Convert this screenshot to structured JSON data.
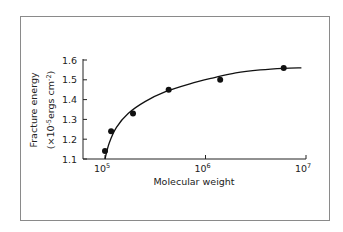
{
  "chart_data": {
    "type": "scatter",
    "title": "",
    "xlabel": "Molecular weight",
    "ylabel": "Fracture energy",
    "ylabel_units_prefix": "(×10",
    "ylabel_units_exp": "-5",
    "ylabel_units_mid": "ergs cm",
    "ylabel_units_exp2": "-2",
    "ylabel_units_suffix": ")",
    "x_scale": "log",
    "xlim": [
      63000,
      10000000
    ],
    "ylim": [
      1.1,
      1.6
    ],
    "grid": false,
    "legend": null,
    "x_ticks": [
      {
        "value": 100000,
        "base": "10",
        "exp": "5"
      },
      {
        "value": 1000000,
        "base": "10",
        "exp": "6"
      },
      {
        "value": 10000000,
        "base": "10",
        "exp": "7"
      }
    ],
    "y_ticks": [
      "1.1",
      "1.2",
      "1.3",
      "1.4",
      "1.5",
      "1.6"
    ],
    "series": [
      {
        "name": "Measured",
        "style": "filled-circle",
        "points": [
          {
            "x": 100000,
            "y": 1.14
          },
          {
            "x": 115000,
            "y": 1.24
          },
          {
            "x": 190000,
            "y": 1.33
          },
          {
            "x": 430000,
            "y": 1.45
          },
          {
            "x": 1400000,
            "y": 1.5
          },
          {
            "x": 6000000,
            "y": 1.56
          }
        ]
      },
      {
        "name": "Fitted curve",
        "style": "line",
        "points": [
          {
            "x": 100000,
            "y": 1.1
          },
          {
            "x": 110000,
            "y": 1.18
          },
          {
            "x": 130000,
            "y": 1.26
          },
          {
            "x": 170000,
            "y": 1.33
          },
          {
            "x": 250000,
            "y": 1.39
          },
          {
            "x": 400000,
            "y": 1.44
          },
          {
            "x": 700000,
            "y": 1.48
          },
          {
            "x": 1200000,
            "y": 1.51
          },
          {
            "x": 2000000,
            "y": 1.535
          },
          {
            "x": 3500000,
            "y": 1.55
          },
          {
            "x": 6000000,
            "y": 1.558
          },
          {
            "x": 9000000,
            "y": 1.56
          }
        ]
      }
    ]
  }
}
